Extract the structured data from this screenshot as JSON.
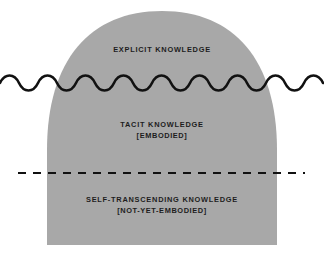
{
  "figure": {
    "type": "conceptual-diagram",
    "shape_name": "knowledge-dome",
    "background_color": "#ffffff",
    "dome_fill_color": "#a8a8a8",
    "line_color": "#111111",
    "text_color": "#1d1d1d"
  },
  "layers": [
    {
      "id": "explicit",
      "name": "explicit-knowledge-layer",
      "primary_label": "EXPLICIT KNOWLEDGE",
      "secondary_label": ""
    },
    {
      "id": "tacit",
      "name": "tacit-knowledge-layer",
      "primary_label": "TACIT KNOWLEDGE",
      "secondary_label": "[EMBODIED]"
    },
    {
      "id": "self_transcending",
      "name": "self-transcending-knowledge-layer",
      "primary_label": "SELF-TRANSCENDING KNOWLEDGE",
      "secondary_label": "[NOT-YET-EMBODIED]"
    }
  ],
  "dividers": [
    {
      "id": "wavy",
      "name": "wavy-divider",
      "style": "wave",
      "y": 83,
      "stroke_width": 2.6,
      "amplitude": 5,
      "wavelength": 38,
      "color": "#111111"
    },
    {
      "id": "dashed",
      "name": "dashed-divider",
      "style": "dashed",
      "y": 173,
      "stroke_width": 2.2,
      "dash": "8 7",
      "color": "#111111",
      "x_start": 18,
      "x_end": 305
    }
  ],
  "dome_geometry": {
    "apex_y": 11,
    "base_y": 245,
    "left_x": 47,
    "right_x": 277,
    "center_x": 162
  }
}
